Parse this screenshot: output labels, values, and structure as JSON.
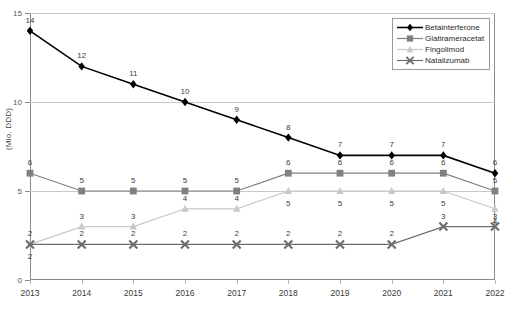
{
  "chart_data": {
    "type": "line",
    "title": "",
    "xlabel": "",
    "ylabel": "(Mio. DDD)",
    "categories": [
      "2013",
      "2014",
      "2015",
      "2016",
      "2017",
      "2018",
      "2019",
      "2020",
      "2021",
      "2022"
    ],
    "ylim": [
      0,
      15
    ],
    "yticks": [
      0,
      5,
      10,
      15
    ],
    "grid": true,
    "legend_position": "top-right",
    "series": [
      {
        "name": "Betainterferone",
        "color": "#000000",
        "marker": "diamond",
        "values": [
          14,
          12,
          11,
          10,
          9,
          8,
          7,
          7,
          7,
          6
        ],
        "label_positions": [
          "above",
          "above",
          "above",
          "above",
          "above",
          "above",
          "above",
          "above",
          "above",
          "above"
        ]
      },
      {
        "name": "Glatirameracetat",
        "color": "#808080",
        "marker": "square",
        "values": [
          6,
          5,
          5,
          5,
          5,
          6,
          6,
          6,
          6,
          5
        ],
        "label_positions": [
          "above",
          "above",
          "above",
          "above",
          "above",
          "above",
          "above",
          "above",
          "above",
          "above"
        ]
      },
      {
        "name": "Fingolimod",
        "color": "#c8c8c8",
        "marker": "triangle",
        "values": [
          2,
          3,
          3,
          4,
          4,
          5,
          5,
          5,
          5,
          4
        ],
        "label_positions": [
          "above",
          "above",
          "above",
          "above",
          "above",
          "below",
          "below",
          "below",
          "below",
          "below"
        ]
      },
      {
        "name": "Natalizumab",
        "color": "#6e6e6e",
        "marker": "cross",
        "values": [
          2,
          2,
          2,
          2,
          2,
          2,
          2,
          2,
          3,
          3
        ],
        "label_positions": [
          "below",
          "above",
          "above",
          "above",
          "above",
          "above",
          "above",
          "above",
          "above",
          "above"
        ]
      }
    ]
  },
  "axis": {
    "y_tick_labels": [
      "0",
      "5",
      "10",
      "15"
    ],
    "y_title": "(Mio. DDD)"
  },
  "legend": {
    "entries": [
      {
        "label": "Betainterferone"
      },
      {
        "label": "Glatirameracetat"
      },
      {
        "label": "Fingolimod"
      },
      {
        "label": "Natalizumab"
      }
    ]
  }
}
